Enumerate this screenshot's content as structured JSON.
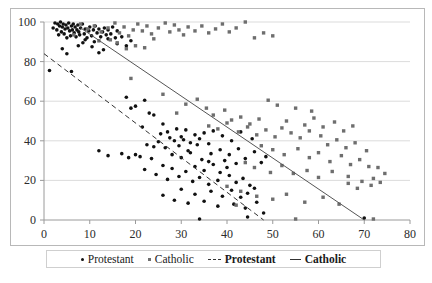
{
  "chart_data": {
    "type": "scatter",
    "title": "",
    "xlabel": "",
    "ylabel": "",
    "xlim": [
      0,
      80
    ],
    "ylim": [
      0,
      100
    ],
    "xticks": [
      0,
      10,
      20,
      30,
      40,
      50,
      60,
      70,
      80
    ],
    "yticks": [
      0,
      20,
      40,
      60,
      80,
      100
    ],
    "grid": "horizontal",
    "legend_position": "bottom",
    "series": [
      {
        "name": "Protestant",
        "marker": "circle",
        "color": "#111111",
        "points": [
          [
            1.2,
            75.5
          ],
          [
            2.0,
            97.0
          ],
          [
            2.4,
            99.5
          ],
          [
            2.8,
            96.0
          ],
          [
            3.0,
            99.0
          ],
          [
            3.2,
            93.5
          ],
          [
            3.4,
            98.0
          ],
          [
            3.6,
            100.0
          ],
          [
            3.8,
            95.0
          ],
          [
            4.0,
            97.5
          ],
          [
            4.2,
            99.0
          ],
          [
            4.4,
            94.0
          ],
          [
            4.6,
            96.5
          ],
          [
            4.8,
            98.5
          ],
          [
            5.0,
            92.0
          ],
          [
            5.2,
            97.0
          ],
          [
            5.4,
            99.5
          ],
          [
            5.6,
            95.5
          ],
          [
            5.8,
            93.0
          ],
          [
            6.0,
            98.0
          ],
          [
            6.2,
            96.0
          ],
          [
            6.4,
            99.0
          ],
          [
            6.6,
            94.5
          ],
          [
            6.8,
            97.5
          ],
          [
            7.0,
            92.5
          ],
          [
            7.2,
            96.0
          ],
          [
            7.4,
            98.5
          ],
          [
            7.6,
            95.0
          ],
          [
            7.8,
            93.5
          ],
          [
            8.0,
            97.0
          ],
          [
            8.4,
            99.0
          ],
          [
            8.8,
            94.0
          ],
          [
            9.0,
            96.5
          ],
          [
            9.4,
            92.0
          ],
          [
            9.8,
            95.5
          ],
          [
            10.0,
            97.5
          ],
          [
            10.4,
            93.0
          ],
          [
            10.8,
            96.0
          ],
          [
            11.2,
            98.0
          ],
          [
            11.6,
            94.5
          ],
          [
            12.0,
            96.5
          ],
          [
            12.4,
            92.5
          ],
          [
            12.8,
            95.0
          ],
          [
            13.2,
            97.0
          ],
          [
            13.6,
            93.5
          ],
          [
            14.0,
            96.0
          ],
          [
            14.6,
            94.0
          ],
          [
            15.0,
            97.5
          ],
          [
            15.6,
            92.0
          ],
          [
            16.0,
            95.5
          ],
          [
            4.0,
            86.5
          ],
          [
            5.0,
            84.0
          ],
          [
            6.0,
            75.0
          ],
          [
            7.5,
            88.0
          ],
          [
            9.0,
            91.0
          ],
          [
            10.5,
            87.5
          ],
          [
            8.5,
            89.5
          ],
          [
            11.0,
            90.0
          ],
          [
            13.0,
            86.0
          ],
          [
            14.0,
            91.5
          ],
          [
            12.0,
            84.5
          ],
          [
            16.0,
            89.0
          ],
          [
            17.0,
            92.5
          ],
          [
            18.0,
            88.0
          ],
          [
            19.0,
            90.5
          ],
          [
            20.0,
            57.5
          ],
          [
            19.0,
            56.5
          ],
          [
            21.5,
            47.0
          ],
          [
            23.0,
            54.0
          ],
          [
            24.0,
            53.0
          ],
          [
            18.0,
            62.0
          ],
          [
            22.0,
            60.5
          ],
          [
            25.5,
            43.5
          ],
          [
            27.0,
            44.5
          ],
          [
            28.5,
            40.0
          ],
          [
            26.0,
            48.5
          ],
          [
            29.0,
            46.0
          ],
          [
            30.0,
            42.0
          ],
          [
            31.0,
            45.5
          ],
          [
            32.0,
            39.0
          ],
          [
            33.0,
            43.0
          ],
          [
            34.0,
            41.0
          ],
          [
            35.0,
            44.0
          ],
          [
            36.0,
            38.5
          ],
          [
            22.5,
            38.0
          ],
          [
            24.0,
            37.0
          ],
          [
            25.0,
            39.5
          ],
          [
            26.5,
            36.5
          ],
          [
            27.5,
            41.5
          ],
          [
            29.5,
            37.5
          ],
          [
            30.5,
            40.5
          ],
          [
            31.5,
            35.0
          ],
          [
            33.5,
            38.0
          ],
          [
            20.0,
            33.0
          ],
          [
            21.0,
            32.0
          ],
          [
            23.5,
            31.0
          ],
          [
            14.0,
            32.5
          ],
          [
            17.0,
            33.5
          ],
          [
            18.5,
            31.5
          ],
          [
            12.0,
            35.0
          ],
          [
            28.0,
            33.0
          ],
          [
            30.0,
            31.5
          ],
          [
            32.0,
            34.0
          ],
          [
            34.5,
            30.5
          ],
          [
            36.5,
            33.5
          ],
          [
            26.0,
            27.5
          ],
          [
            28.0,
            26.0
          ],
          [
            31.0,
            24.5
          ],
          [
            33.0,
            27.0
          ],
          [
            35.0,
            25.0
          ],
          [
            37.0,
            28.0
          ],
          [
            38.5,
            24.0
          ],
          [
            40.0,
            26.5
          ],
          [
            22.0,
            25.5
          ],
          [
            24.5,
            23.0
          ],
          [
            27.0,
            20.5
          ],
          [
            29.5,
            22.0
          ],
          [
            32.5,
            19.5
          ],
          [
            34.0,
            21.5
          ],
          [
            36.0,
            18.0
          ],
          [
            38.0,
            20.0
          ],
          [
            40.5,
            22.5
          ],
          [
            42.0,
            19.0
          ],
          [
            43.5,
            21.0
          ],
          [
            45.0,
            17.5
          ],
          [
            30.0,
            15.5
          ],
          [
            33.0,
            13.0
          ],
          [
            36.5,
            14.5
          ],
          [
            39.0,
            12.0
          ],
          [
            41.0,
            15.0
          ],
          [
            43.0,
            11.5
          ],
          [
            44.5,
            13.5
          ],
          [
            46.0,
            16.0
          ],
          [
            26.0,
            12.5
          ],
          [
            28.5,
            10.0
          ],
          [
            31.5,
            8.5
          ],
          [
            35.0,
            9.5
          ],
          [
            38.0,
            7.0
          ],
          [
            41.5,
            8.0
          ],
          [
            44.0,
            6.0
          ],
          [
            46.5,
            9.0
          ],
          [
            34.0,
            0.5
          ],
          [
            44.5,
            1.5
          ],
          [
            48.0,
            3.5
          ],
          [
            70.0,
            1.0
          ],
          [
            37.0,
            45.0
          ],
          [
            39.0,
            42.5
          ],
          [
            41.0,
            40.0
          ],
          [
            43.0,
            44.5
          ],
          [
            45.5,
            41.0
          ],
          [
            38.5,
            35.5
          ],
          [
            40.5,
            33.0
          ],
          [
            42.5,
            36.0
          ],
          [
            44.0,
            31.0
          ],
          [
            46.0,
            34.5
          ],
          [
            47.5,
            29.0
          ],
          [
            48.5,
            32.0
          ],
          [
            36.0,
            29.5
          ],
          [
            39.5,
            30.0
          ],
          [
            42.0,
            28.5
          ]
        ]
      },
      {
        "name": "Catholic",
        "marker": "square",
        "color": "#6e6e6e",
        "points": [
          [
            6.5,
            93.5
          ],
          [
            8.0,
            99.0
          ],
          [
            9.5,
            96.5
          ],
          [
            11.0,
            98.0
          ],
          [
            12.5,
            95.0
          ],
          [
            14.0,
            97.0
          ],
          [
            15.5,
            99.5
          ],
          [
            16.5,
            94.5
          ],
          [
            17.5,
            97.5
          ],
          [
            18.5,
            93.0
          ],
          [
            19.5,
            96.0
          ],
          [
            20.5,
            99.0
          ],
          [
            21.5,
            95.5
          ],
          [
            22.5,
            98.0
          ],
          [
            23.5,
            94.0
          ],
          [
            25.0,
            97.0
          ],
          [
            26.5,
            99.5
          ],
          [
            27.5,
            95.0
          ],
          [
            28.5,
            98.5
          ],
          [
            29.5,
            96.0
          ],
          [
            30.5,
            93.5
          ],
          [
            31.5,
            97.5
          ],
          [
            33.0,
            95.5
          ],
          [
            34.5,
            98.0
          ],
          [
            36.0,
            94.5
          ],
          [
            37.5,
            96.5
          ],
          [
            39.0,
            99.0
          ],
          [
            40.5,
            95.0
          ],
          [
            42.0,
            97.0
          ],
          [
            44.0,
            100.0
          ],
          [
            46.0,
            92.0
          ],
          [
            48.0,
            94.5
          ],
          [
            50.0,
            93.0
          ],
          [
            14.5,
            91.0
          ],
          [
            16.0,
            89.5
          ],
          [
            12.0,
            90.5
          ],
          [
            20.0,
            88.0
          ],
          [
            24.0,
            91.5
          ],
          [
            18.0,
            86.5
          ],
          [
            22.0,
            87.0
          ],
          [
            19.0,
            71.5
          ],
          [
            26.0,
            63.5
          ],
          [
            31.0,
            58.5
          ],
          [
            33.5,
            61.0
          ],
          [
            35.5,
            56.5
          ],
          [
            29.0,
            54.0
          ],
          [
            37.0,
            53.0
          ],
          [
            39.5,
            55.5
          ],
          [
            41.0,
            50.5
          ],
          [
            43.0,
            52.0
          ],
          [
            45.0,
            48.5
          ],
          [
            47.0,
            51.0
          ],
          [
            36.0,
            47.5
          ],
          [
            38.0,
            46.0
          ],
          [
            40.0,
            49.0
          ],
          [
            42.5,
            44.5
          ],
          [
            44.5,
            47.0
          ],
          [
            46.5,
            43.0
          ],
          [
            48.5,
            45.5
          ],
          [
            50.5,
            42.0
          ],
          [
            52.0,
            46.5
          ],
          [
            54.0,
            44.0
          ],
          [
            56.0,
            41.5
          ],
          [
            58.0,
            45.0
          ],
          [
            60.5,
            42.5
          ],
          [
            62.0,
            38.0
          ],
          [
            64.0,
            40.5
          ],
          [
            66.0,
            36.5
          ],
          [
            68.0,
            39.0
          ],
          [
            70.5,
            35.0
          ],
          [
            73.0,
            26.5
          ],
          [
            55.0,
            56.5
          ],
          [
            58.5,
            55.0
          ],
          [
            51.0,
            58.0
          ],
          [
            49.0,
            60.5
          ],
          [
            53.0,
            50.0
          ],
          [
            57.0,
            48.0
          ],
          [
            59.0,
            51.5
          ],
          [
            61.0,
            47.0
          ],
          [
            63.5,
            49.5
          ],
          [
            65.5,
            45.0
          ],
          [
            67.5,
            47.5
          ],
          [
            47.5,
            37.5
          ],
          [
            50.0,
            35.5
          ],
          [
            52.5,
            33.0
          ],
          [
            55.5,
            36.0
          ],
          [
            58.0,
            31.5
          ],
          [
            60.0,
            34.0
          ],
          [
            62.5,
            29.5
          ],
          [
            65.0,
            32.5
          ],
          [
            67.0,
            28.0
          ],
          [
            69.0,
            30.5
          ],
          [
            71.0,
            27.0
          ],
          [
            44.0,
            29.0
          ],
          [
            46.0,
            26.5
          ],
          [
            49.5,
            24.0
          ],
          [
            52.0,
            27.5
          ],
          [
            54.5,
            23.5
          ],
          [
            57.5,
            25.0
          ],
          [
            60.0,
            21.5
          ],
          [
            63.0,
            24.5
          ],
          [
            66.5,
            22.0
          ],
          [
            69.5,
            19.5
          ],
          [
            72.0,
            21.0
          ],
          [
            74.5,
            23.5
          ],
          [
            55.0,
            0.5
          ],
          [
            66.5,
            18.5
          ],
          [
            68.5,
            16.0
          ],
          [
            71.5,
            17.5
          ],
          [
            73.5,
            19.0
          ],
          [
            40.0,
            17.0
          ],
          [
            43.0,
            14.5
          ],
          [
            46.5,
            12.0
          ],
          [
            50.0,
            10.5
          ],
          [
            53.0,
            13.0
          ],
          [
            57.0,
            9.0
          ],
          [
            61.0,
            11.5
          ],
          [
            64.5,
            8.0
          ],
          [
            72.0,
            0.5
          ],
          [
            42.0,
            7.5
          ]
        ]
      }
    ],
    "trendlines": [
      {
        "name": "Protestant",
        "style": "dashed",
        "color": "#333333",
        "x0": 0.0,
        "y0": 84.0,
        "x1": 48.0,
        "y1": 0.0
      },
      {
        "name": "Catholic",
        "style": "solid",
        "color": "#555555",
        "x0": 8.0,
        "y0": 97.0,
        "x1": 70.0,
        "y1": 0.0
      }
    ]
  },
  "legend": {
    "items": [
      {
        "label": "Protestant",
        "marker": "dot-marker",
        "bold": false
      },
      {
        "label": "Catholic",
        "marker": "square-marker",
        "bold": false
      },
      {
        "label": "Protestant",
        "marker": "dashed-line",
        "bold": true
      },
      {
        "label": "Catholic",
        "marker": "solid-line",
        "bold": true
      }
    ]
  }
}
